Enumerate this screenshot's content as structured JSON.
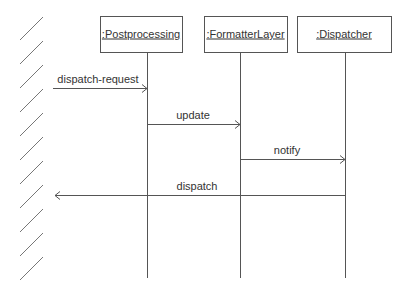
{
  "diagram": {
    "type": "sequence",
    "colors": {
      "line": "#555555",
      "hatch": "#777777",
      "text": "#333333",
      "background": "#ffffff"
    },
    "boundary": {
      "x1": 20,
      "x2": 43,
      "y_start": 17,
      "count": 11,
      "spacing": 24,
      "rise": 23
    },
    "lifeline_bottom": 278,
    "participants": [
      {
        "label": ":Postprocessing",
        "box": {
          "x": 100,
          "y": 16,
          "w": 82,
          "h": 36
        },
        "lifeline_x": 147
      },
      {
        "label": ":FormatterLayer",
        "box": {
          "x": 204,
          "y": 16,
          "w": 83,
          "h": 36
        },
        "lifeline_x": 240
      },
      {
        "label": ":Dispatcher",
        "box": {
          "x": 297,
          "y": 16,
          "w": 94,
          "h": 36
        },
        "lifeline_x": 345
      }
    ],
    "messages": [
      {
        "label": "dispatch-request",
        "from_x": 53,
        "to_x": 147,
        "y": 88,
        "label_x": 98
      },
      {
        "label": "update",
        "from_x": 147,
        "to_x": 240,
        "y": 124,
        "label_x": 193
      },
      {
        "label": "notify",
        "from_x": 240,
        "to_x": 345,
        "y": 159,
        "label_x": 287
      },
      {
        "label": "dispatch",
        "from_x": 345,
        "to_x": 55,
        "y": 195,
        "label_x": 197
      }
    ]
  }
}
